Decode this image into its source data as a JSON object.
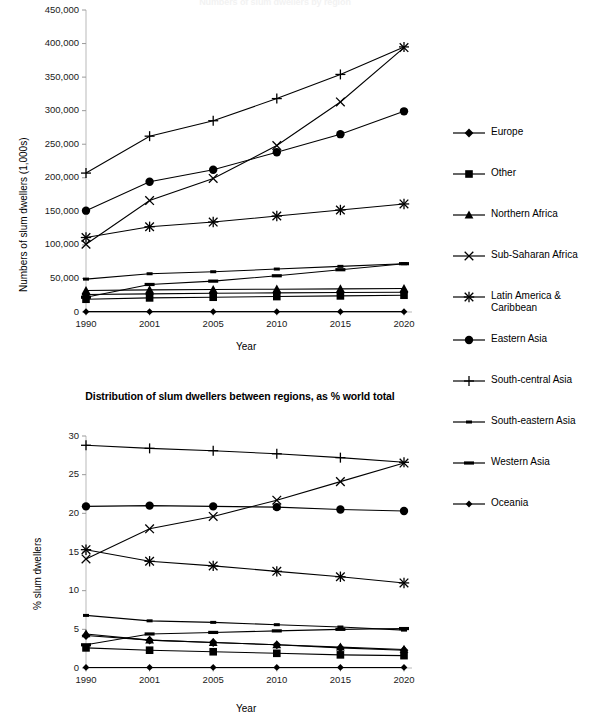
{
  "page": {
    "cut_off_top_title": "Numbers of slum dwellers by region"
  },
  "legend": {
    "items": [
      {
        "label": "Europe",
        "marker": "diamond"
      },
      {
        "label": "Other",
        "marker": "square"
      },
      {
        "label": "Northern Africa",
        "marker": "triangle"
      },
      {
        "label": "Sub-Saharan Africa",
        "marker": "cross"
      },
      {
        "label": "Latin America &\nCaribbean",
        "marker": "star"
      },
      {
        "label": "Eastern Asia",
        "marker": "circle"
      },
      {
        "label": "South-central Asia",
        "marker": "plus"
      },
      {
        "label": "South-eastern Asia",
        "marker": "dash-small"
      },
      {
        "label": "Western Asia",
        "marker": "dash-wide"
      },
      {
        "label": "Oceania",
        "marker": "diamond-small"
      }
    ]
  },
  "chart_data": [
    {
      "id": "numbers-chart",
      "type": "line",
      "title": "",
      "xlabel": "Year",
      "ylabel": "Numbers of slum dwellers (1,000s)",
      "categories": [
        "1990",
        "2001",
        "2005",
        "2010",
        "2015",
        "2020"
      ],
      "x": [
        1990,
        2001,
        2005,
        2010,
        2015,
        2020
      ],
      "ylim": [
        0,
        450000
      ],
      "yticks": [
        0,
        50000,
        100000,
        150000,
        200000,
        250000,
        300000,
        350000,
        400000,
        450000
      ],
      "ytick_labels": [
        "0",
        "50,000",
        "100,000",
        "150,000",
        "200,000",
        "250,000",
        "300,000",
        "350,000",
        "400,000",
        "450,000"
      ],
      "grid": false,
      "legend_position": "right",
      "series": [
        {
          "name": "South-central Asia",
          "marker": "plus",
          "values": [
            207000,
            262000,
            285000,
            318000,
            354000,
            395000
          ]
        },
        {
          "name": "Eastern Asia",
          "marker": "circle",
          "values": [
            151000,
            194000,
            212000,
            238000,
            265000,
            299000
          ]
        },
        {
          "name": "Sub-Saharan Africa",
          "marker": "cross",
          "values": [
            101000,
            166000,
            199000,
            248000,
            313000,
            394000
          ]
        },
        {
          "name": "Latin America & Caribbean",
          "marker": "star",
          "values": [
            111000,
            127000,
            134000,
            143000,
            152000,
            161000
          ]
        },
        {
          "name": "South-eastern Asia",
          "marker": "dash-small",
          "values": [
            49000,
            57000,
            60000,
            64000,
            68000,
            72000
          ]
        },
        {
          "name": "Western Asia",
          "marker": "dash-wide",
          "values": [
            22000,
            41000,
            46000,
            54000,
            63000,
            72000
          ]
        },
        {
          "name": "Northern Africa",
          "marker": "triangle",
          "values": [
            32000,
            33000,
            33500,
            34000,
            34500,
            35000
          ]
        },
        {
          "name": "Other",
          "marker": "square",
          "values": [
            19000,
            21000,
            22000,
            23000,
            24000,
            25000
          ]
        },
        {
          "name": "Europe",
          "marker": "diamond",
          "values": [
            26000,
            27000,
            28000,
            28500,
            29000,
            29500
          ]
        },
        {
          "name": "Oceania",
          "marker": "diamond-small",
          "values": [
            500,
            500,
            500,
            500,
            500,
            500
          ]
        }
      ]
    },
    {
      "id": "distribution-chart",
      "type": "line",
      "title": "Distribution of slum dwellers between regions, as % world total",
      "xlabel": "Year",
      "ylabel": "% slum dwellers",
      "categories": [
        "1990",
        "2001",
        "2005",
        "2010",
        "2015",
        "2020"
      ],
      "x": [
        1990,
        2001,
        2005,
        2010,
        2015,
        2020
      ],
      "ylim": [
        0,
        30
      ],
      "yticks": [
        0,
        5,
        10,
        15,
        20,
        25,
        30
      ],
      "ytick_labels": [
        "0",
        "5",
        "10",
        "15",
        "20",
        "25",
        "30"
      ],
      "grid": false,
      "legend_position": "right",
      "series": [
        {
          "name": "South-central Asia",
          "marker": "plus",
          "values": [
            28.8,
            28.4,
            28.1,
            27.7,
            27.2,
            26.6
          ]
        },
        {
          "name": "Eastern Asia",
          "marker": "circle",
          "values": [
            20.9,
            21.0,
            20.9,
            20.8,
            20.5,
            20.3
          ]
        },
        {
          "name": "Sub-Saharan Africa",
          "marker": "cross",
          "values": [
            14.1,
            18.0,
            19.6,
            21.7,
            24.1,
            26.5
          ]
        },
        {
          "name": "Latin America & Caribbean",
          "marker": "star",
          "values": [
            15.3,
            13.8,
            13.2,
            12.5,
            11.8,
            11.0
          ]
        },
        {
          "name": "South-eastern Asia",
          "marker": "dash-small",
          "values": [
            6.8,
            6.1,
            5.9,
            5.6,
            5.3,
            4.9
          ]
        },
        {
          "name": "Western Asia",
          "marker": "dash-wide",
          "values": [
            3.0,
            4.4,
            4.6,
            4.8,
            5.0,
            5.1
          ]
        },
        {
          "name": "Northern Africa",
          "marker": "triangle",
          "values": [
            4.4,
            3.6,
            3.3,
            3.0,
            2.7,
            2.4
          ]
        },
        {
          "name": "Europe",
          "marker": "diamond",
          "values": [
            4.2,
            3.6,
            3.3,
            3.0,
            2.6,
            2.3
          ]
        },
        {
          "name": "Other",
          "marker": "square",
          "values": [
            2.6,
            2.3,
            2.1,
            1.9,
            1.7,
            1.6
          ]
        },
        {
          "name": "Oceania",
          "marker": "diamond-small",
          "values": [
            0.07,
            0.07,
            0.07,
            0.07,
            0.07,
            0.07
          ]
        }
      ]
    }
  ]
}
